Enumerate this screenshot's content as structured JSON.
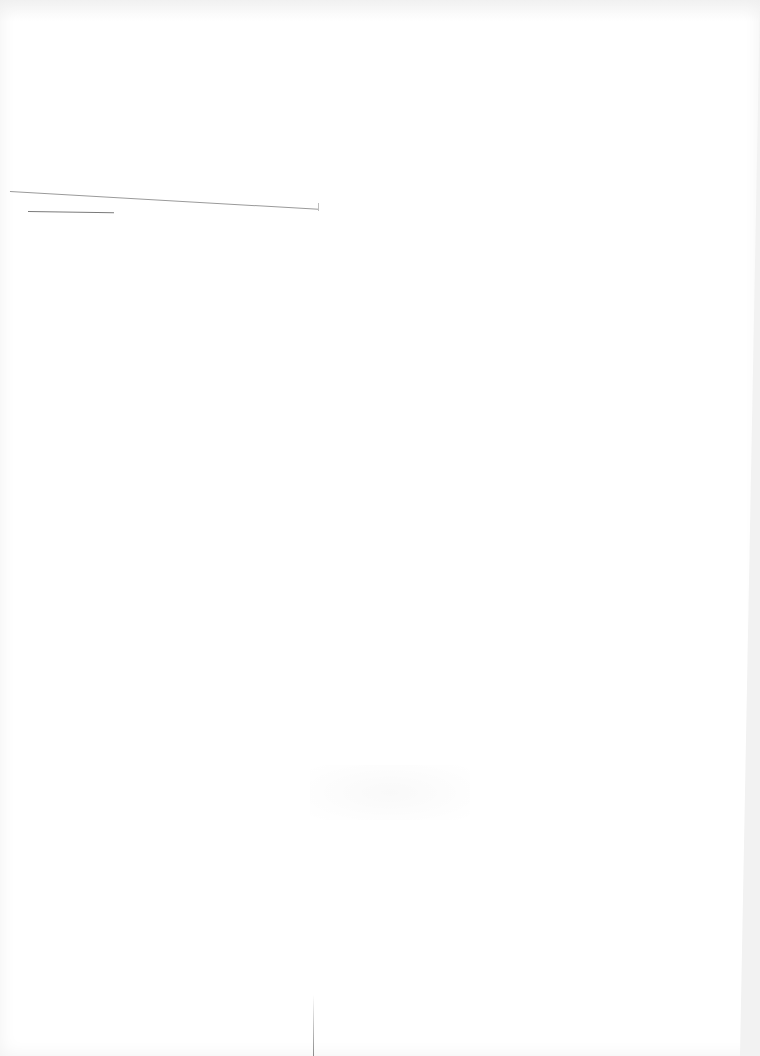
{
  "document": {
    "type": "scanned blank page",
    "text": "",
    "marks": [
      {
        "kind": "ruled-line",
        "name": "long-rule"
      },
      {
        "kind": "ruled-line",
        "name": "short-rule"
      },
      {
        "kind": "fold-mark",
        "name": "bottom-center-mark"
      }
    ]
  }
}
